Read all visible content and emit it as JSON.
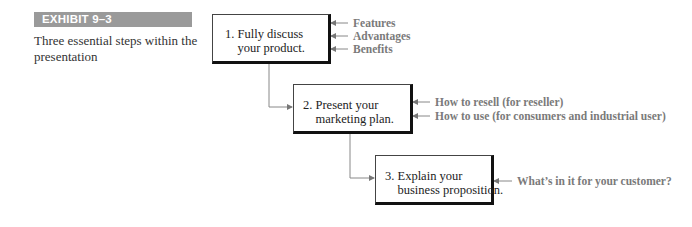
{
  "exhibit": {
    "label": "EXHIBIT 9–3",
    "caption": "Three essential steps within the presentation",
    "bar_color": "#9a9a9a"
  },
  "steps": [
    {
      "number": "1.",
      "text": "1. Fully discuss\n    your product.",
      "inputs": [
        "Features",
        "Advantages",
        "Benefits"
      ]
    },
    {
      "number": "2.",
      "text": "2. Present your\n    marketing plan.",
      "inputs": [
        "How to resell (for reseller)",
        "How to use (for consumers and industrial user)"
      ]
    },
    {
      "number": "3.",
      "text": "3. Explain your\n    business proposition.",
      "inputs": [
        "What’s in it for your customer?"
      ]
    }
  ],
  "colors": {
    "label_text": "#7a7a7a",
    "connector": "#888888",
    "box_border": "#111111"
  }
}
